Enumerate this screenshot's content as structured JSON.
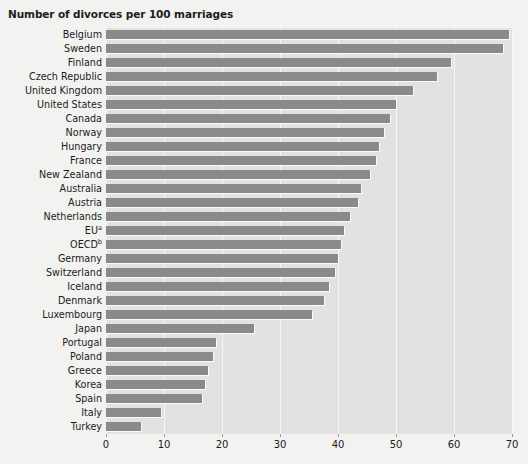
{
  "chart": {
    "title": "Number of divorces per 100 marriages"
  },
  "axis": {
    "ticks": [
      "0",
      "10",
      "20",
      "30",
      "40",
      "50",
      "60",
      "70"
    ]
  },
  "colors": {
    "bar": "#8a8a8a",
    "plot_background": "#e2e2e0",
    "figure_background": "#f2f2f0",
    "gridline": "#f7f7f6",
    "text": "#1c1c1c"
  },
  "chart_data": {
    "type": "bar",
    "orientation": "horizontal",
    "title": "Number of divorces per 100 marriages",
    "xlabel": "",
    "ylabel": "",
    "xlim": [
      0,
      70
    ],
    "xticks": [
      0,
      10,
      20,
      30,
      40,
      50,
      60,
      70
    ],
    "grid": true,
    "legend": "none",
    "categories": [
      "Belgium",
      "Sweden",
      "Finland",
      "Czech Republic",
      "United Kingdom",
      "United States",
      "Canada",
      "Norway",
      "Hungary",
      "France",
      "New Zealand",
      "Australia",
      "Austria",
      "Netherlands",
      "EU",
      "OECD",
      "Germany",
      "Switzerland",
      "Iceland",
      "Denmark",
      "Luxembourg",
      "Japan",
      "Portugal",
      "Poland",
      "Greece",
      "Korea",
      "Spain",
      "Italy",
      "Turkey"
    ],
    "category_labels_html": [
      "Belgium",
      "Sweden",
      "Finland",
      "Czech Republic",
      "United Kingdom",
      "United States",
      "Canada",
      "Norway",
      "Hungary",
      "France",
      "New Zealand",
      "Australia",
      "Austria",
      "Netherlands",
      "EU<sup>a</sup>",
      "OECD<sup>b</sup>",
      "Germany",
      "Switzerland",
      "Iceland",
      "Denmark",
      "Luxembourg",
      "Japan",
      "Portugal",
      "Poland",
      "Greece",
      "Korea",
      "Spain",
      "Italy",
      "Turkey"
    ],
    "values": [
      69.5,
      68.5,
      59.5,
      57.0,
      53.0,
      50.0,
      49.0,
      48.0,
      47.0,
      46.5,
      45.5,
      44.0,
      43.5,
      42.0,
      41.0,
      40.5,
      40.0,
      39.5,
      38.5,
      37.5,
      35.5,
      25.5,
      19.0,
      18.5,
      17.5,
      17.0,
      16.5,
      9.5,
      6.0
    ]
  }
}
